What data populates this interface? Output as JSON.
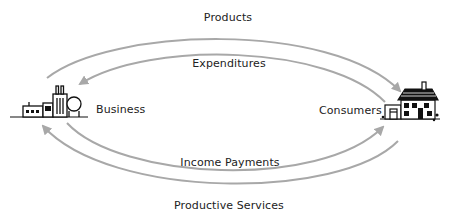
{
  "diagram": {
    "type": "circular-flow",
    "nodes": {
      "business": {
        "label": "Business",
        "icon": "factory-icon"
      },
      "consumers": {
        "label": "Consumers",
        "icon": "house-icon"
      }
    },
    "flows": {
      "products": {
        "label": "Products",
        "from": "Business",
        "to": "Consumers"
      },
      "expenditures": {
        "label": "Expenditures",
        "from": "Consumers",
        "to": "Business"
      },
      "income_payments": {
        "label": "Income Payments",
        "from": "Business",
        "to": "Consumers"
      },
      "productive_services": {
        "label": "Productive Services",
        "from": "Consumers",
        "to": "Business"
      }
    },
    "colors": {
      "arrow": "#a8a8a8",
      "text": "#222222",
      "icon": "#111111",
      "background": "#ffffff"
    }
  }
}
